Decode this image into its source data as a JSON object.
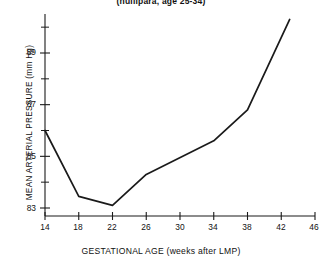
{
  "chart_data": {
    "type": "line",
    "title": "(nullipara, age 25-34)",
    "xlabel": "GESTATIONAL AGE (weeks after LMP)",
    "ylabel": "MEAN ARTERIAL PRESSURE (mm Hg)",
    "xlim": [
      14,
      46
    ],
    "ylim": [
      83,
      90.5
    ],
    "xticks": [
      14,
      18,
      22,
      26,
      30,
      34,
      38,
      42,
      46
    ],
    "xtick_labels": [
      "14",
      "18",
      "22",
      "26",
      "30",
      "34",
      "38",
      "42",
      "46"
    ],
    "yticks": [
      83,
      85,
      87,
      89
    ],
    "ytick_labels": [
      "83",
      "85",
      "87",
      "89"
    ],
    "yminorticks": [
      84,
      86,
      88,
      90
    ],
    "grid": false,
    "legend": null,
    "line_color": "#1a1a1a",
    "x": [
      14,
      18,
      22,
      26,
      34,
      38,
      43
    ],
    "values": [
      86.0,
      83.45,
      83.1,
      84.3,
      85.6,
      86.8,
      90.3
    ],
    "series": [
      {
        "name": "Mean arterial pressure",
        "x": [
          14,
          18,
          22,
          26,
          34,
          38,
          43
        ],
        "values": [
          86.0,
          83.45,
          83.1,
          84.3,
          85.6,
          86.8,
          90.3
        ]
      }
    ]
  },
  "axis": {
    "x_tick_0": "14",
    "x_tick_1": "18",
    "x_tick_2": "22",
    "x_tick_3": "26",
    "x_tick_4": "30",
    "x_tick_5": "34",
    "x_tick_6": "38",
    "x_tick_7": "42",
    "x_tick_8": "46",
    "y_tick_0": "83",
    "y_tick_1": "85",
    "y_tick_2": "87",
    "y_tick_3": "89"
  }
}
